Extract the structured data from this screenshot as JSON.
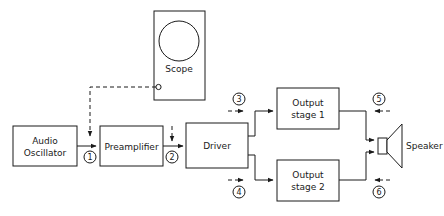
{
  "diagram": {
    "stroke_color": "#1a1a1a",
    "background_color": "#ffffff",
    "blocks": [
      {
        "id": "audio-oscillator",
        "label_line1": "Audio",
        "label_line2": "Oscillator"
      },
      {
        "id": "preamplifier",
        "label_line1": "Preamplifier",
        "label_line2": ""
      },
      {
        "id": "driver",
        "label_line1": "Driver",
        "label_line2": ""
      },
      {
        "id": "output-stage-1",
        "label_line1": "Output",
        "label_line2": "stage 1"
      },
      {
        "id": "output-stage-2",
        "label_line1": "Output",
        "label_line2": "stage 2"
      },
      {
        "id": "scope",
        "label_line1": "Scope",
        "label_line2": ""
      }
    ],
    "speaker": {
      "label": "Speaker"
    },
    "test_points": [
      {
        "id": "tp-1",
        "number": "1"
      },
      {
        "id": "tp-2",
        "number": "2"
      },
      {
        "id": "tp-3",
        "number": "3"
      },
      {
        "id": "tp-4",
        "number": "4"
      },
      {
        "id": "tp-5",
        "number": "5"
      },
      {
        "id": "tp-6",
        "number": "6"
      }
    ]
  }
}
